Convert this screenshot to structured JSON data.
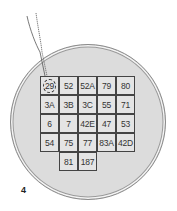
{
  "figure": {
    "number": "4",
    "colors": {
      "circle_fill": "#dcdcdc",
      "cell_fill": "#e4e4e4",
      "line": "#444444"
    },
    "grid": {
      "rows": [
        [
          "29",
          "52",
          "52A",
          "79",
          "80"
        ],
        [
          "3A",
          "3B",
          "3C",
          "55",
          "71"
        ],
        [
          "6",
          "7",
          "42E",
          "47",
          "53"
        ],
        [
          "54",
          "75",
          "77",
          "83A",
          "42D"
        ],
        [
          "",
          "81",
          "187",
          "",
          ""
        ]
      ],
      "highlighted": "29"
    },
    "probe": {
      "target": "29"
    }
  }
}
